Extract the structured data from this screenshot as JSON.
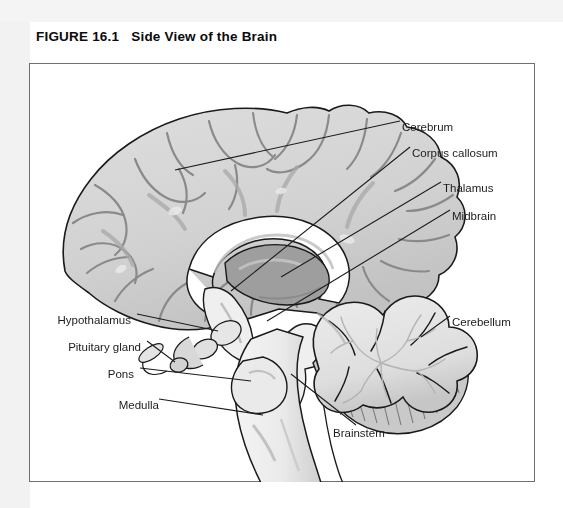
{
  "figure": {
    "number": "FIGURE 16.1",
    "title": "Side View of the Brain"
  },
  "colors": {
    "page_background": "#ffffff",
    "panel_tint": "#f2f2f2",
    "box_border": "#6f6f6f",
    "cerebrum_fill": "#d6d6d6",
    "cerebrum_shadow": "#b3b3b3",
    "sulci_line": "#8d8d8d",
    "corpus_callosum_fill": "#ffffff",
    "thalamus_fill": "#9e9e9e",
    "brainstem_fill": "#ededed",
    "cerebellum_fill": "#e2e2e2",
    "cerebellum_shadow": "#bdbdbd",
    "outline": "#1a1a1a",
    "leader_line": "#1c1c1c",
    "label_text": "#1c1c1c"
  },
  "labels": [
    {
      "id": "cerebrum",
      "text": "Cerebrum",
      "side": "right",
      "x": 402,
      "y": 121
    },
    {
      "id": "corpus-callosum",
      "text": "Corpus callosum",
      "side": "right",
      "x": 412,
      "y": 147
    },
    {
      "id": "thalamus",
      "text": "Thalamus",
      "side": "right",
      "x": 443,
      "y": 182
    },
    {
      "id": "midbrain",
      "text": "Midbrain",
      "side": "right",
      "x": 452,
      "y": 210
    },
    {
      "id": "cerebellum",
      "text": "Cerebellum",
      "side": "right",
      "x": 452,
      "y": 316
    },
    {
      "id": "hypothalamus",
      "text": "Hypothalamus",
      "side": "left",
      "x": 131,
      "y": 314
    },
    {
      "id": "pituitary-gland",
      "text": "Pituitary gland",
      "side": "left",
      "x": 141,
      "y": 341
    },
    {
      "id": "pons",
      "text": "Pons",
      "side": "left",
      "x": 134,
      "y": 368
    },
    {
      "id": "medulla",
      "text": "Medulla",
      "side": "left",
      "x": 159,
      "y": 399
    },
    {
      "id": "brainstem",
      "text": "Brainstem",
      "side": "right",
      "x": 333,
      "y": 427
    }
  ]
}
